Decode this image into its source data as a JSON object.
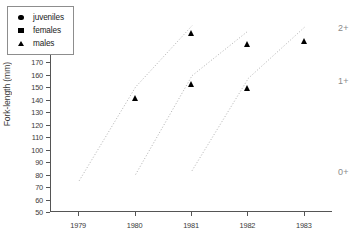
{
  "chart_data": {
    "type": "scatter",
    "title": "",
    "xlabel": "",
    "ylabel": "Fork-length (mm)",
    "x": [
      1979,
      1980,
      1981,
      1982,
      1983
    ],
    "xtick_labels": [
      "1979",
      "1980",
      "1981",
      "1982",
      "1983"
    ],
    "ylim": [
      50,
      210
    ],
    "ytick_step": 10,
    "ytick_labels": [
      "210",
      "200",
      "190",
      "180",
      "170",
      "160",
      "150",
      "140",
      "130",
      "120",
      "110",
      "100",
      "90",
      "80",
      "70",
      "60",
      "50"
    ],
    "grid": false,
    "legend_position": "top-left",
    "legend": [
      {
        "name": "juveniles",
        "marker": "circle"
      },
      {
        "name": "females",
        "marker": "square"
      },
      {
        "name": "males",
        "marker": "triangle"
      }
    ],
    "series": [
      {
        "name": "juveniles",
        "marker": "circle",
        "points": [
          {
            "x": 1979,
            "y": 75,
            "cohort": "0+"
          },
          {
            "x": 1980,
            "y": 137,
            "cohort": "1+"
          },
          {
            "x": 1980,
            "y": 80,
            "cohort": "0+"
          },
          {
            "x": 1981,
            "y": 149.5,
            "cohort": "1+"
          },
          {
            "x": 1981,
            "y": 83,
            "cohort": "0+"
          },
          {
            "x": 1982,
            "y": 149.5,
            "cohort": "1+"
          }
        ]
      },
      {
        "name": "females",
        "marker": "square",
        "points": [
          {
            "x": 1980,
            "y": 162,
            "cohort": "1+"
          },
          {
            "x": 1981,
            "y": 196,
            "cohort": "2+"
          },
          {
            "x": 1981,
            "y": 167,
            "cohort": "1+"
          },
          {
            "x": 1982,
            "y": 198,
            "cohort": "2+"
          },
          {
            "x": 1982,
            "y": 164,
            "cohort": "1+"
          },
          {
            "x": 1983,
            "y": 201,
            "cohort": "2+"
          }
        ]
      },
      {
        "name": "males",
        "marker": "triangle",
        "points": [
          {
            "x": 1980,
            "y": 150,
            "cohort": "1+"
          },
          {
            "x": 1981,
            "y": 202,
            "cohort": "2+"
          },
          {
            "x": 1981,
            "y": 161,
            "cohort": "1+"
          },
          {
            "x": 1982,
            "y": 193,
            "cohort": "2+"
          },
          {
            "x": 1982,
            "y": 158,
            "cohort": "1+"
          },
          {
            "x": 1983,
            "y": 196,
            "cohort": "2+"
          }
        ]
      }
    ],
    "cohort_tracks": [
      {
        "name": "cohort-1979",
        "style": "dotted",
        "points": [
          [
            1979,
            75
          ],
          [
            1980,
            150
          ],
          [
            1981,
            199
          ]
        ]
      },
      {
        "name": "cohort-1980",
        "style": "dotted",
        "points": [
          [
            1980,
            80
          ],
          [
            1981,
            159
          ],
          [
            1982,
            195
          ]
        ]
      },
      {
        "name": "cohort-1981",
        "style": "dotted",
        "points": [
          [
            1981,
            83
          ],
          [
            1982,
            157
          ],
          [
            1983,
            198
          ]
        ]
      }
    ],
    "annotations": [
      {
        "text": "2+",
        "y": 197,
        "name": "age-class-2plus"
      },
      {
        "text": "1+",
        "y": 155,
        "name": "age-class-1plus"
      },
      {
        "text": "0+",
        "y": 82,
        "name": "age-class-0plus"
      }
    ],
    "colors": {
      "marker": "#000000",
      "axis": "#555555",
      "tick_text": "#3b3b3b",
      "annotation": "#8a8a8a",
      "legend_border": "#8d8d8d",
      "cohort_line": "#b0b0b0",
      "background": "#ffffff"
    }
  }
}
